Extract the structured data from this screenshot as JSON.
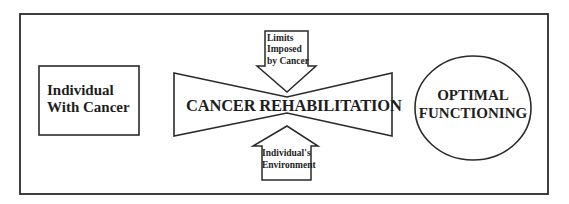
{
  "diagram": {
    "title": "",
    "colors": {
      "stroke": "#2a2a2a",
      "background": "#ffffff",
      "text": "#1e1e1e"
    },
    "nodes": [
      {
        "id": "individual",
        "shape": "rectangle",
        "line1": "Individual",
        "line2": "With Cancer"
      },
      {
        "id": "rehab",
        "shape": "bowtie",
        "label": "CANCER REHABILITATION"
      },
      {
        "id": "limits",
        "shape": "down-arrow",
        "line1": "Limits",
        "line2": "Imposed",
        "line3": "by Cancer"
      },
      {
        "id": "environment",
        "shape": "up-arrow",
        "line1": "Individual's",
        "line2": "Environment"
      },
      {
        "id": "optimal",
        "shape": "ellipse",
        "line1": "OPTIMAL",
        "line2": "FUNCTIONING"
      }
    ],
    "relations": [
      {
        "from": "limits",
        "to": "rehab",
        "direction": "down"
      },
      {
        "from": "environment",
        "to": "rehab",
        "direction": "up"
      }
    ]
  }
}
